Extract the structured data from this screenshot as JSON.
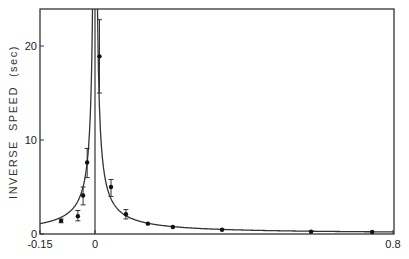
{
  "chart_data": {
    "type": "scatter",
    "title": "",
    "xlabel": "",
    "ylabel": "INVERSE  SPEED  (sec)",
    "xlim": [
      -0.15,
      0.8
    ],
    "ylim": [
      0,
      24
    ],
    "grid": false,
    "legend": null,
    "x_ticks": [
      {
        "value": -0.15,
        "label": "-0.15"
      },
      {
        "value": 0,
        "label": "0"
      },
      {
        "value": 0.8,
        "label": "0.8"
      }
    ],
    "y_ticks": [
      {
        "value": 0,
        "label": "0"
      },
      {
        "value": 10,
        "label": "10"
      },
      {
        "value": 20,
        "label": "20"
      }
    ],
    "vertical_line_at_x": 0,
    "series": [
      {
        "name": "measured",
        "kind": "points_with_error_bars",
        "points": [
          {
            "x": -0.091,
            "y": 1.4,
            "err_low": 1.2,
            "err_high": 1.6
          },
          {
            "x": -0.046,
            "y": 1.9,
            "err_low": 1.4,
            "err_high": 2.5
          },
          {
            "x": -0.032,
            "y": 4.1,
            "err_low": 3.1,
            "err_high": 5.0
          },
          {
            "x": -0.021,
            "y": 7.6,
            "err_low": 6.0,
            "err_high": 9.1
          },
          {
            "x": 0.012,
            "y": 18.9,
            "err_low": 15.0,
            "err_high": 22.8
          },
          {
            "x": 0.043,
            "y": 5.0,
            "err_low": 4.0,
            "err_high": 5.8
          },
          {
            "x": 0.083,
            "y": 2.1,
            "err_low": 1.6,
            "err_high": 2.6
          },
          {
            "x": 0.142,
            "y": 1.1,
            "err_low": 1.0,
            "err_high": 1.2
          },
          {
            "x": 0.209,
            "y": 0.75,
            "err_low": 0.7,
            "err_high": 0.8
          },
          {
            "x": 0.341,
            "y": 0.45,
            "err_low": 0.4,
            "err_high": 0.5
          },
          {
            "x": 0.58,
            "y": 0.25,
            "err_low": 0.2,
            "err_high": 0.3
          },
          {
            "x": 0.744,
            "y": 0.22,
            "err_low": 0.18,
            "err_high": 0.26
          }
        ]
      },
      {
        "name": "fit",
        "kind": "line",
        "description": "symmetric cusp curve ~ a/|x| diverging at x=0",
        "x": [
          -0.15,
          -0.1,
          -0.06,
          -0.04,
          -0.03,
          -0.02,
          -0.012,
          -0.006,
          0.006,
          0.012,
          0.02,
          0.03,
          0.04,
          0.06,
          0.1,
          0.15,
          0.2,
          0.3,
          0.4,
          0.5,
          0.6,
          0.7,
          0.8
        ],
        "y": [
          1.2,
          1.8,
          3.0,
          4.5,
          6.0,
          9.0,
          15.0,
          30.0,
          30.0,
          15.0,
          9.0,
          6.0,
          4.5,
          3.0,
          1.8,
          1.2,
          0.9,
          0.6,
          0.45,
          0.36,
          0.3,
          0.26,
          0.22
        ]
      }
    ]
  }
}
